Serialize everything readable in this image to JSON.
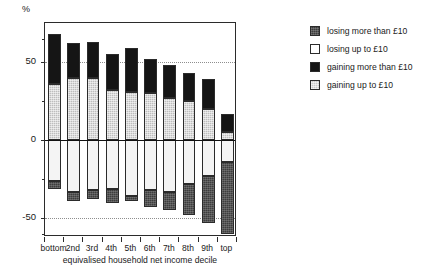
{
  "chart_data": {
    "type": "bar",
    "title": "",
    "xlabel": "equivalised household net income decile",
    "ylabel": "%",
    "ylim": [
      -62,
      75
    ],
    "yticks": [
      50,
      0,
      -50
    ],
    "ytick_labels": [
      "50",
      "0",
      "-50"
    ],
    "yminor_ticks": [
      65,
      25,
      -25,
      -60
    ],
    "grid": "dotted horizontal gridlines at 50 and -50",
    "stacked": true,
    "legend_position": "right",
    "categories": [
      "bottom",
      "2nd",
      "3rd",
      "4th",
      "5th",
      "6th",
      "7th",
      "8th",
      "9th",
      "top"
    ],
    "series": [
      {
        "name": "gaining more than £10",
        "color": "#151515",
        "values": [
          32,
          22,
          23,
          23,
          28,
          22,
          21,
          18,
          19,
          12
        ]
      },
      {
        "name": "gaining up to £10",
        "color": "#bdbdbd",
        "values": [
          36,
          40,
          40,
          32,
          31,
          30,
          27,
          25,
          20,
          5
        ]
      },
      {
        "name": "losing up to £10",
        "color": "#f4f4f4",
        "values": [
          -26,
          -33,
          -32,
          -31,
          -36,
          -32,
          -33,
          -28,
          -23,
          -14
        ]
      },
      {
        "name": "losing more than £10",
        "color": "#3d3d3d",
        "values": [
          -5,
          -6,
          -6,
          -9,
          -3,
          -11,
          -12,
          -20,
          -30,
          -46
        ]
      }
    ]
  },
  "axes": {
    "y_unit_label": "%",
    "x_axis_title": "equivalised household net income decile"
  },
  "legend": {
    "items": [
      {
        "label": "losing more than £10",
        "swatch": "lose-more"
      },
      {
        "label": "losing up to £10",
        "swatch": "lose-up"
      },
      {
        "label": "gaining more than £10",
        "swatch": "gain-more"
      },
      {
        "label": "gaining up to £10",
        "swatch": "gain-up"
      }
    ]
  }
}
